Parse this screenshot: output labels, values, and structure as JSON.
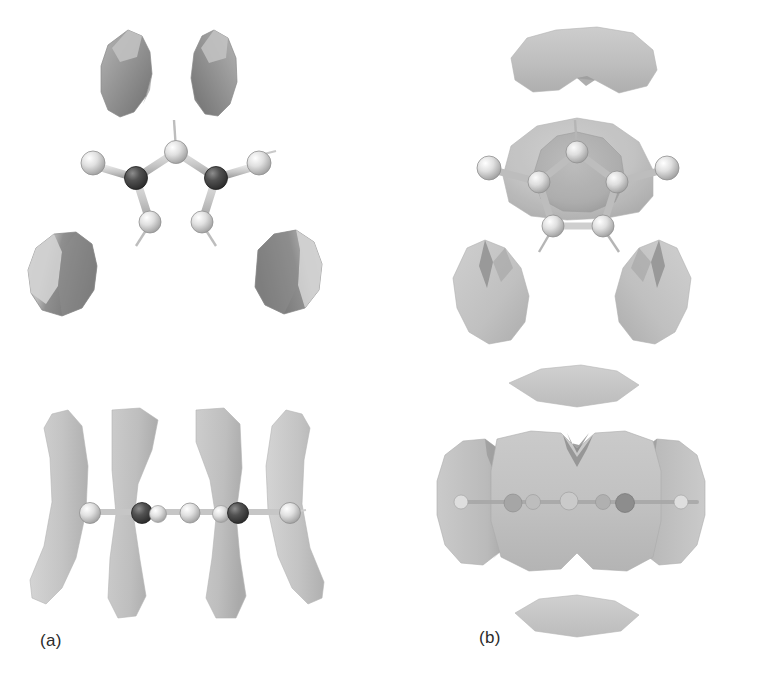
{
  "figure": {
    "caption_labels": {
      "panel_a": "(a)",
      "panel_b": "(b)"
    },
    "background_color": "#ffffff",
    "width": 761,
    "height": 678
  },
  "palette": {
    "isosurface_light": "#c9c9c9",
    "isosurface_mid": "#a8a8a8",
    "isosurface_dark": "#7d7d7d",
    "isosurface_shadow": "#5e5e5e",
    "isosurface_translucent": "#bfbfbf",
    "atom_light": "#e3e3e3",
    "atom_light_edge": "#9a9a9a",
    "atom_dark": "#4a4a4a",
    "atom_dark_edge": "#2c2c2c",
    "bond": "#c4c4c4",
    "bond_edge": "#9e9e9e",
    "hydrogen_stick": "#b0b0b0",
    "label_color": "#2b2b2b"
  },
  "panels": [
    {
      "id": "panel-a",
      "label": "(a)",
      "description": "Molecular orbital isosurface of five-membered heterocyclic ring, narrow separated lobes",
      "views": [
        {
          "id": "a-top",
          "orientation": "top view",
          "molecule": {
            "type": "five-membered-ring",
            "ring_atoms": [
              {
                "name": "C-apex",
                "shade": "light"
              },
              {
                "name": "N-left",
                "shade": "dark"
              },
              {
                "name": "N-right",
                "shade": "dark"
              },
              {
                "name": "C-lower-left",
                "shade": "light"
              },
              {
                "name": "C-lower-right",
                "shade": "light"
              }
            ],
            "substituents": [
              {
                "name": "substituent-left",
                "shade": "light"
              },
              {
                "name": "substituent-right",
                "shade": "light"
              }
            ],
            "hydrogens": 3
          },
          "lobes": [
            {
              "name": "lobe-upper-left",
              "shape": "teardrop",
              "tone": "dark"
            },
            {
              "name": "lobe-upper-right",
              "shape": "teardrop",
              "tone": "dark"
            },
            {
              "name": "lobe-lower-left",
              "shape": "rounded",
              "tone": "mixed"
            },
            {
              "name": "lobe-lower-right",
              "shape": "rounded",
              "tone": "mixed"
            }
          ]
        },
        {
          "id": "a-edge",
          "orientation": "edge-on view",
          "molecule": {
            "type": "ring-edge-on-chain",
            "chain_atoms": [
              {
                "name": "atom-1",
                "shade": "light"
              },
              {
                "name": "atom-2",
                "shade": "dark"
              },
              {
                "name": "atom-3",
                "shade": "light"
              },
              {
                "name": "atom-4",
                "shade": "light"
              },
              {
                "name": "atom-5",
                "shade": "dark"
              },
              {
                "name": "atom-6",
                "shade": "light"
              }
            ]
          },
          "lobes": [
            {
              "name": "crescent-outer-left",
              "shape": "crescent",
              "tone": "light"
            },
            {
              "name": "crescent-inner-left",
              "shape": "vertical-lobe",
              "tone": "light"
            },
            {
              "name": "crescent-inner-right",
              "shape": "vertical-lobe",
              "tone": "light"
            },
            {
              "name": "crescent-outer-right",
              "shape": "crescent",
              "tone": "light"
            }
          ]
        }
      ]
    },
    {
      "id": "panel-b",
      "label": "(b)",
      "description": "Molecular orbital isosurface of five-membered heterocyclic ring, broad merged lobes",
      "views": [
        {
          "id": "b-top",
          "orientation": "top view",
          "molecule": {
            "type": "five-membered-ring",
            "ring_atoms": [
              {
                "name": "C-apex",
                "shade": "light"
              },
              {
                "name": "N-left",
                "shade": "light"
              },
              {
                "name": "N-right",
                "shade": "light"
              },
              {
                "name": "C-lower-left",
                "shade": "light"
              },
              {
                "name": "C-lower-right",
                "shade": "light"
              }
            ],
            "substituents": [
              {
                "name": "substituent-left",
                "shade": "light"
              },
              {
                "name": "substituent-right",
                "shade": "light"
              }
            ],
            "hydrogens": 3
          },
          "lobes": [
            {
              "name": "lobe-top-kidney",
              "shape": "kidney",
              "tone": "light"
            },
            {
              "name": "lobe-central-envelope",
              "shape": "dome",
              "tone": "translucent"
            },
            {
              "name": "lobe-lower-left-teardrop",
              "shape": "teardrop",
              "tone": "light"
            },
            {
              "name": "lobe-lower-right-teardrop",
              "shape": "teardrop",
              "tone": "light"
            }
          ]
        },
        {
          "id": "b-edge",
          "orientation": "edge-on view",
          "molecule": {
            "type": "ring-edge-on-chain",
            "chain_atoms": [
              {
                "name": "atom-1",
                "shade": "light"
              },
              {
                "name": "atom-2",
                "shade": "dark"
              },
              {
                "name": "atom-3",
                "shade": "light"
              },
              {
                "name": "atom-4",
                "shade": "light"
              },
              {
                "name": "atom-5",
                "shade": "dark"
              },
              {
                "name": "atom-6",
                "shade": "light"
              }
            ]
          },
          "lobes": [
            {
              "name": "lens-upper",
              "shape": "lens",
              "tone": "light"
            },
            {
              "name": "lobe-side-left",
              "shape": "leaf",
              "tone": "light"
            },
            {
              "name": "lobe-central-mass",
              "shape": "notched-block",
              "tone": "light"
            },
            {
              "name": "lobe-side-right",
              "shape": "leaf",
              "tone": "light"
            },
            {
              "name": "lens-lower",
              "shape": "lens",
              "tone": "light"
            }
          ]
        }
      ]
    }
  ]
}
